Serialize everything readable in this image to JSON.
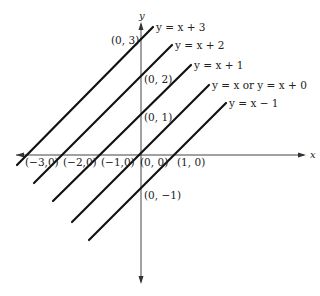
{
  "diagram": {
    "axes": {
      "x_label": "x",
      "y_label": "y"
    },
    "lines": [
      {
        "label": "y = x + 3",
        "x1": 17,
        "y1": 165,
        "x2": 153,
        "y2": 27,
        "lx": 156,
        "ly": 31
      },
      {
        "label": "y = x + 2",
        "x1": 34,
        "y1": 183,
        "x2": 172,
        "y2": 45,
        "lx": 175,
        "ly": 49
      },
      {
        "label": "y = x + 1",
        "x1": 53,
        "y1": 201,
        "x2": 191,
        "y2": 65,
        "lx": 194,
        "ly": 69
      },
      {
        "label": "y = x or y = x + 0",
        "x1": 72,
        "y1": 222,
        "x2": 209,
        "y2": 85,
        "lx": 212,
        "ly": 89
      },
      {
        "label": "y = x − 1",
        "x1": 89,
        "y1": 240,
        "x2": 226,
        "y2": 103,
        "lx": 229,
        "ly": 107
      }
    ],
    "points": [
      {
        "label": "(0, 3)",
        "lx": 111,
        "ly": 44
      },
      {
        "label": "(0, 2)",
        "lx": 144,
        "ly": 83
      },
      {
        "label": "(0, 1)",
        "lx": 144,
        "ly": 121
      },
      {
        "label": "(0, −1)",
        "lx": 144,
        "ly": 199
      },
      {
        "label": "(−3,0)",
        "lx": 25,
        "ly": 166
      },
      {
        "label": "(−2,0)",
        "lx": 63,
        "ly": 166
      },
      {
        "label": "(−1,0)",
        "lx": 101,
        "ly": 166
      },
      {
        "label": "(0, 0)",
        "lx": 140,
        "ly": 166
      },
      {
        "label": "(1, 0)",
        "lx": 177,
        "ly": 166
      }
    ]
  }
}
